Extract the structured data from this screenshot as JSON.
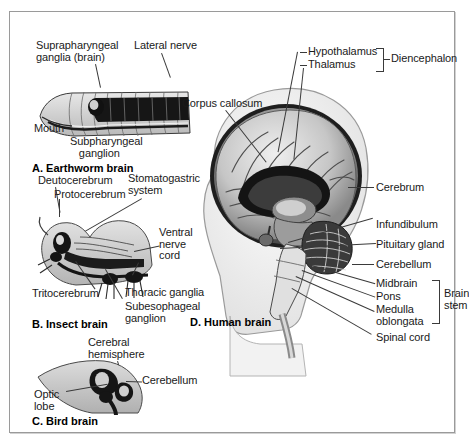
{
  "figure": {
    "panels": [
      {
        "id": "earthworm",
        "caption": "A. Earthworm brain",
        "labels": [
          {
            "name": "suprapharyngeal-ganglia",
            "text": "Suprapharyngeal\nganglia (brain)"
          },
          {
            "name": "lateral-nerve",
            "text": "Lateral nerve"
          },
          {
            "name": "mouth",
            "text": "Mouth"
          },
          {
            "name": "subpharyngeal-ganglion",
            "text": "Subpharyngeal\n   ganglion"
          }
        ]
      },
      {
        "id": "insect",
        "caption": "B. Insect brain",
        "labels": [
          {
            "name": "deutocerebrum",
            "text": "Deutocerebrum"
          },
          {
            "name": "protocerebrum",
            "text": "Protocerebrum"
          },
          {
            "name": "stomatogastric-system",
            "text": "Stomatogastric\nsystem"
          },
          {
            "name": "ventral-nerve-cord",
            "text": "Ventral\nnerve\ncord"
          },
          {
            "name": "tritocerebrum",
            "text": "Tritocerebrum"
          },
          {
            "name": "thoracic-ganglia",
            "text": "Thoracic ganglia"
          },
          {
            "name": "subesophageal-ganglion",
            "text": "Subesophageal\nganglion"
          }
        ]
      },
      {
        "id": "bird",
        "caption": "C. Bird brain",
        "labels": [
          {
            "name": "cerebral-hemisphere",
            "text": "Cerebral\nhemisphere"
          },
          {
            "name": "cerebellum",
            "text": "Cerebellum"
          },
          {
            "name": "optic-lobe",
            "text": "Optic\nlobe"
          }
        ]
      },
      {
        "id": "human",
        "caption": "D. Human brain",
        "labels": [
          {
            "name": "corpus-callosum",
            "text": "Corpus callosum"
          },
          {
            "name": "hypothalamus",
            "text": "Hypothalamus"
          },
          {
            "name": "thalamus",
            "text": "Thalamus"
          },
          {
            "name": "diencephalon",
            "text": "Diencephalon"
          },
          {
            "name": "cerebrum",
            "text": "Cerebrum"
          },
          {
            "name": "infundibulum",
            "text": "Infundibulum"
          },
          {
            "name": "pituitary-gland",
            "text": "Pituitary gland"
          },
          {
            "name": "cerebellum",
            "text": "Cerebellum"
          },
          {
            "name": "midbrain",
            "text": "Midbrain"
          },
          {
            "name": "pons",
            "text": "Pons"
          },
          {
            "name": "medulla-oblongata",
            "text": "Medulla\noblongata"
          },
          {
            "name": "brain-stem",
            "text": "Brain\nstem"
          },
          {
            "name": "spinal-cord",
            "text": "Spinal cord"
          }
        ]
      }
    ]
  },
  "colors": {
    "border": "#9a9a9a",
    "text": "#1a1a1a",
    "leader": "#3a3a3a",
    "tissue_light": "#d8d8d8",
    "tissue_mid": "#a8a8a8",
    "tissue_dark": "#2b2b2b"
  }
}
